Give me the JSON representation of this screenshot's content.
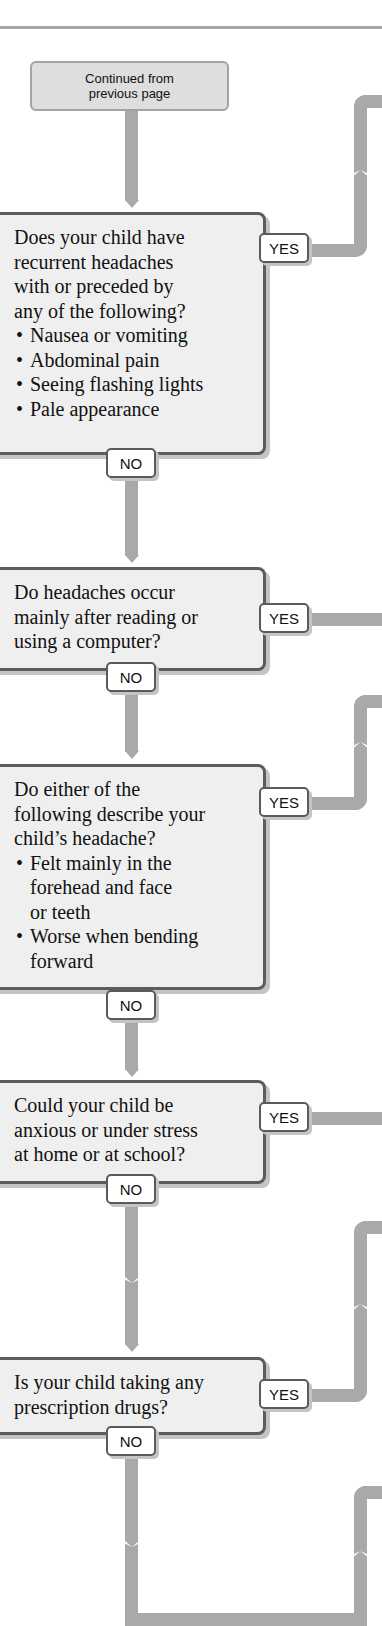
{
  "header": {
    "continued_label": "Continued from\nprevious page"
  },
  "questions": [
    {
      "text": "Does your child have\nrecurrent headaches\nwith or preceded by\nany of the following?",
      "bullets": [
        "Nausea or vomiting",
        "Abdominal pain",
        "Seeing flashing lights",
        "Pale appearance"
      ],
      "yes_label": "YES",
      "no_label": "NO"
    },
    {
      "text": "Do headaches occur\nmainly after reading or\nusing a computer?",
      "bullets": [],
      "yes_label": "YES",
      "no_label": "NO"
    },
    {
      "text": "Do either of the\nfollowing describe your\nchild’s headache?",
      "bullets": [
        "Felt mainly in the\nforehead and face\nor teeth",
        "Worse when bending\nforward"
      ],
      "yes_label": "YES",
      "no_label": "NO"
    },
    {
      "text": "Could your child be\nanxious or under stress\nat home or at school?",
      "bullets": [],
      "yes_label": "YES",
      "no_label": "NO"
    },
    {
      "text": "Is your child taking any\nprescription drugs?",
      "bullets": [],
      "yes_label": "YES",
      "no_label": "NO"
    }
  ],
  "colors": {
    "connector": "#a9a9a9",
    "box_fill": "#efefef",
    "box_border": "#5c5c5c",
    "continued_fill": "#dedede"
  }
}
